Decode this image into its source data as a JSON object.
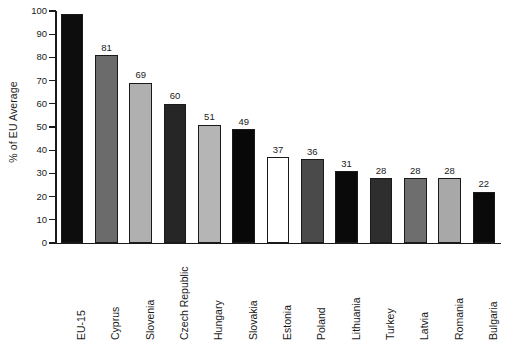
{
  "chart_data": {
    "type": "bar",
    "title": "",
    "subtitle": "",
    "xlabel": "",
    "ylabel": "% of EU Average",
    "ylim": [
      0,
      100
    ],
    "ytick_step": 10,
    "yticks": [
      0,
      10,
      20,
      30,
      40,
      50,
      60,
      70,
      80,
      90,
      100
    ],
    "grid": false,
    "legend": null,
    "value_labels_shown": true,
    "note_first_bar_unlabeled": "EU-15 bar at 100 has no printed value label",
    "categories": [
      "EU-15",
      "Cyprus",
      "Slovenia",
      "Czech Republic",
      "Hungary",
      "Slovakia",
      "Estonia",
      "Poland",
      "Lithuania",
      "Turkey",
      "Latvia",
      "Romania",
      "Bulgaria"
    ],
    "values": [
      100,
      81,
      69,
      60,
      51,
      49,
      37,
      36,
      31,
      28,
      28,
      28,
      22
    ],
    "value_labels": [
      "",
      "81",
      "69",
      "60",
      "51",
      "49",
      "37",
      "36",
      "31",
      "28",
      "28",
      "28",
      "22"
    ],
    "bar_colors": [
      "#0d0d0d",
      "#6b6b6b",
      "#b0b0b0",
      "#262626",
      "#b5b5b5",
      "#080808",
      "#ffffff",
      "#4a4a4a",
      "#0a0a0a",
      "#2e2e2e",
      "#6e6e6e",
      "#a8a8a8",
      "#0a0a0a"
    ],
    "bar_border_color": "#1a1a1a",
    "axis_color": "#1a1a1a",
    "background_color": "#ffffff"
  }
}
